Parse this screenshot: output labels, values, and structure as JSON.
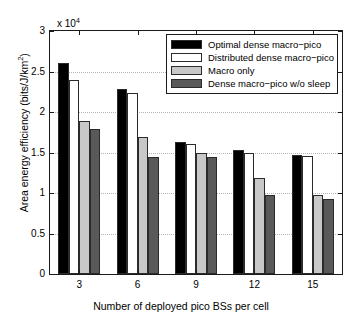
{
  "chart_data": {
    "type": "bar",
    "title": "",
    "xlabel": "Number of deployed pico BSs per cell",
    "ylabel": "Area energy efficiency (bits/J/km2)",
    "ylabel_base": "Area energy efficiency (bits/J/km",
    "ylabel_sup": "2",
    "ylabel_tail": ")",
    "y_exponent_label": "x 10",
    "y_exponent_sup": "4",
    "y_exponent_value": 10000,
    "categories": [
      "3",
      "6",
      "9",
      "12",
      "15"
    ],
    "x_tick_labels": [
      "3",
      "6",
      "9",
      "12",
      "15"
    ],
    "y_tick_labels": [
      "0",
      "0.5",
      "1",
      "1.5",
      "2",
      "2.5",
      "3"
    ],
    "y_tick_values": [
      0,
      0.5,
      1,
      1.5,
      2,
      2.5,
      3
    ],
    "ylim": [
      0,
      3
    ],
    "grid": true,
    "grid_axis": "y",
    "legend_position": "top-right",
    "series": [
      {
        "name": "Optimal dense macro-pico",
        "color": "#000000",
        "values": [
          2.6,
          2.29,
          1.63,
          1.53,
          1.47
        ]
      },
      {
        "name": "Distributed dense macro-pico",
        "color": "#ffffff",
        "values": [
          2.4,
          2.24,
          1.6,
          1.49,
          1.46
        ]
      },
      {
        "name": "Macro only",
        "color": "#c8c8c8",
        "values": [
          1.89,
          1.69,
          1.5,
          1.18,
          0.975
        ]
      },
      {
        "name": "Dense macro-pico w/o sleep",
        "color": "#595959",
        "values": [
          1.79,
          1.44,
          1.44,
          0.98,
          0.93
        ]
      }
    ]
  },
  "legend": {
    "items": [
      {
        "label": "Optimal dense macro−pico",
        "color": "#000000"
      },
      {
        "label": "Distributed dense macro−pico",
        "color": "#ffffff"
      },
      {
        "label": "Macro only",
        "color": "#c8c8c8"
      },
      {
        "label": "Dense macro−pico w/o sleep",
        "color": "#595959"
      }
    ]
  }
}
